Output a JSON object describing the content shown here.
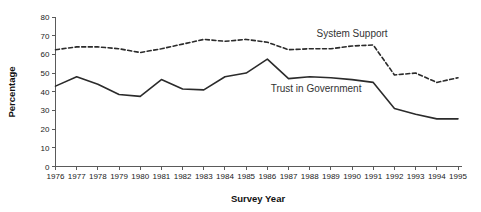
{
  "chart_data": {
    "type": "line",
    "title": "",
    "xlabel": "Survey Year",
    "ylabel": "Percentage",
    "x": [
      1976,
      1977,
      1978,
      1979,
      1980,
      1981,
      1982,
      1983,
      1984,
      1985,
      1986,
      1987,
      1988,
      1989,
      1990,
      1991,
      1992,
      1993,
      1994,
      1995
    ],
    "xtick_labels": [
      "1976",
      "1977",
      "1978",
      "1979",
      "1980",
      "1981",
      "1982",
      "1983",
      "1984",
      "1985",
      "1986",
      "1987",
      "1988",
      "1989",
      "1990",
      "1991",
      "1992",
      "1993",
      "1994",
      "1995"
    ],
    "ytick_labels": [
      "0",
      "10",
      "20",
      "30",
      "40",
      "50",
      "60",
      "70",
      "80"
    ],
    "yticks": [
      0,
      10,
      20,
      30,
      40,
      50,
      60,
      70,
      80
    ],
    "ylim": [
      0,
      80
    ],
    "xlim": [
      1976,
      1995
    ],
    "grid": false,
    "legend_position": "inline-annotation",
    "series": [
      {
        "name": "System Support",
        "style": "dashed",
        "color": "#2b2b2b",
        "label_text": "System Support",
        "values": [
          62.5,
          64.0,
          64.0,
          63.0,
          61.0,
          63.0,
          65.5,
          68.0,
          67.0,
          68.0,
          66.5,
          62.5,
          63.0,
          63.0,
          64.5,
          65.0,
          49.0,
          50.0,
          45.0,
          47.5
        ]
      },
      {
        "name": "Trust in Government",
        "style": "solid",
        "color": "#2b2b2b",
        "label_text": "Trust in Government",
        "values": [
          43.0,
          48.0,
          44.0,
          38.5,
          37.5,
          46.5,
          41.5,
          41.0,
          48.0,
          50.0,
          57.5,
          47.0,
          48.0,
          47.5,
          46.5,
          45.0,
          31.0,
          28.0,
          25.5,
          25.5
        ]
      }
    ],
    "annotations": [
      {
        "text": "System Support",
        "x": 1990.0,
        "y": 69.5
      },
      {
        "text": "Trust in Government",
        "x": 1988.3,
        "y": 40.0
      }
    ]
  }
}
